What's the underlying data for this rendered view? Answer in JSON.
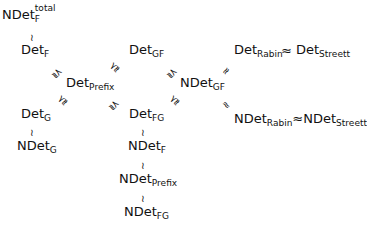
{
  "nodes": {
    "ndet_f_total": {
      "base": "NDet",
      "sup": "total",
      "sub": "F"
    },
    "det_f": {
      "base": "Det",
      "sub": "F"
    },
    "det_gf": {
      "base": "Det",
      "sub": "GF"
    },
    "det_prefix": {
      "base": "Det",
      "sub": "Prefix"
    },
    "ndet_gf": {
      "base": "NDet",
      "sub": "GF"
    },
    "det_rabin": {
      "base": "Det",
      "sub": "Rabin"
    },
    "det_streett": {
      "base": "Det",
      "sub": "Streett"
    },
    "det_g": {
      "base": "Det",
      "sub": "G"
    },
    "det_fg": {
      "base": "Det",
      "sub": "FG"
    },
    "ndet_rabin": {
      "base": "NDet",
      "sub": "Rabin"
    },
    "ndet_streett": {
      "base": "NDet",
      "sub": "Streett"
    },
    "ndet_g": {
      "base": "NDet",
      "sub": "G"
    },
    "ndet_f": {
      "base": "NDet",
      "sub": "F"
    },
    "ndet_prefix": {
      "base": "NDet",
      "sub": "Prefix"
    },
    "ndet_fg": {
      "base": "NDet",
      "sub": "FG"
    }
  },
  "relations": {
    "approx": "≈",
    "vertical_approx": "≀",
    "strict_approx": "⪷"
  }
}
